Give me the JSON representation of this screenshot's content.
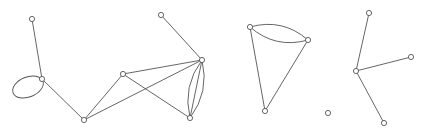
{
  "diagram": {
    "type": "undirected-multigraph",
    "canvas": {
      "width": 426,
      "height": 133,
      "background": "#ffffff"
    },
    "style": {
      "edge_color": "#555555",
      "node_fill": "#ffffff",
      "node_stroke": "#555555",
      "node_radius": 2.6
    },
    "components": [
      {
        "id": "component-1",
        "nodes": [
          {
            "id": "A",
            "x": 32,
            "y": 19
          },
          {
            "id": "B",
            "x": 42,
            "y": 79
          },
          {
            "id": "C",
            "x": 84,
            "y": 120
          },
          {
            "id": "D",
            "x": 123,
            "y": 74
          },
          {
            "id": "E",
            "x": 161,
            "y": 15
          },
          {
            "id": "F",
            "x": 202,
            "y": 60
          },
          {
            "id": "G",
            "x": 190,
            "y": 118
          }
        ],
        "edges": [
          {
            "from": "A",
            "to": "B",
            "shape": "line"
          },
          {
            "from": "B",
            "to": "B",
            "shape": "self-loop"
          },
          {
            "from": "B",
            "to": "C",
            "shape": "line"
          },
          {
            "from": "C",
            "to": "D",
            "shape": "line"
          },
          {
            "from": "C",
            "to": "F",
            "shape": "line"
          },
          {
            "from": "D",
            "to": "F",
            "shape": "line"
          },
          {
            "from": "D",
            "to": "G",
            "shape": "line"
          },
          {
            "from": "E",
            "to": "F",
            "shape": "line"
          },
          {
            "from": "F",
            "to": "G",
            "shape": "line"
          },
          {
            "from": "F",
            "to": "G",
            "shape": "arc-left"
          },
          {
            "from": "F",
            "to": "G",
            "shape": "arc-right"
          }
        ]
      },
      {
        "id": "component-2",
        "nodes": [
          {
            "id": "H",
            "x": 250,
            "y": 27
          },
          {
            "id": "I",
            "x": 308,
            "y": 40
          },
          {
            "id": "J",
            "x": 265,
            "y": 111
          }
        ],
        "edges": [
          {
            "from": "H",
            "to": "I",
            "shape": "arc-up"
          },
          {
            "from": "H",
            "to": "I",
            "shape": "arc-down"
          },
          {
            "from": "H",
            "to": "J",
            "shape": "line"
          },
          {
            "from": "I",
            "to": "J",
            "shape": "line"
          }
        ]
      },
      {
        "id": "component-3",
        "nodes": [
          {
            "id": "K",
            "x": 328,
            "y": 113
          }
        ],
        "edges": []
      },
      {
        "id": "component-4",
        "nodes": [
          {
            "id": "L",
            "x": 369,
            "y": 13
          },
          {
            "id": "M",
            "x": 356,
            "y": 71
          },
          {
            "id": "N",
            "x": 411,
            "y": 57
          },
          {
            "id": "O",
            "x": 384,
            "y": 123
          }
        ],
        "edges": [
          {
            "from": "L",
            "to": "M",
            "shape": "line"
          },
          {
            "from": "M",
            "to": "N",
            "shape": "line"
          },
          {
            "from": "M",
            "to": "O",
            "shape": "line"
          }
        ]
      }
    ]
  }
}
